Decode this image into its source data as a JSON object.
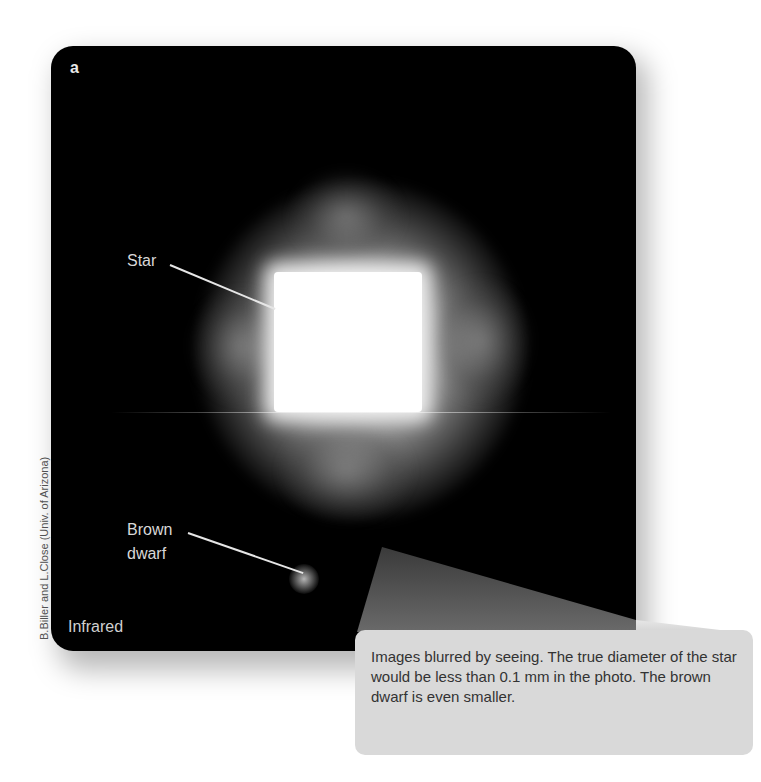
{
  "figure": {
    "panel_letter": "a",
    "labels": {
      "star": "Star",
      "brown_dwarf": "Brown dwarf",
      "band": "Infrared"
    },
    "credit": "B.Biller and L.Close (Univ. of Arizona)",
    "callout": {
      "text": "Images blurred by seeing. The true diameter of the star would be less than 0.1 mm in the photo. The brown dwarf is even smaller."
    },
    "colors": {
      "panel_background": "#000000",
      "label_text": "#d8d8d8",
      "callout_background": "#d9d9d9",
      "callout_text": "#333333",
      "wedge": "#5a5a5a"
    }
  }
}
